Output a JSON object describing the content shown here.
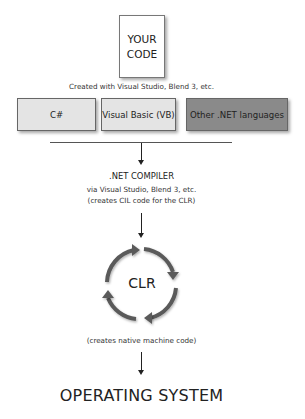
{
  "source_box": {
    "line1": "YOUR",
    "line2": "CODE"
  },
  "source_caption": "Created with Visual Studio, Blend 3, etc.",
  "languages": [
    {
      "label": "C#",
      "fill": "#e4e4e4"
    },
    {
      "label": "Visual Basic (VB)",
      "fill": "#e4e4e4"
    },
    {
      "label": "Other .NET languages",
      "fill": "#8a8a8a"
    }
  ],
  "compiler": {
    "title": ".NET COMPILER",
    "line1": "via Visual Studio, Blend 3, etc.",
    "line2": "(creates CIL code for the CLR)"
  },
  "clr": {
    "label": "CLR",
    "icon": "cycle-arrows-icon",
    "caption": "(creates native machine code)"
  },
  "target": {
    "label": "OPERATING SYSTEM"
  },
  "colors": {
    "arrow": "#222222",
    "cycle": "#5a5a5a",
    "border": "#666666"
  }
}
